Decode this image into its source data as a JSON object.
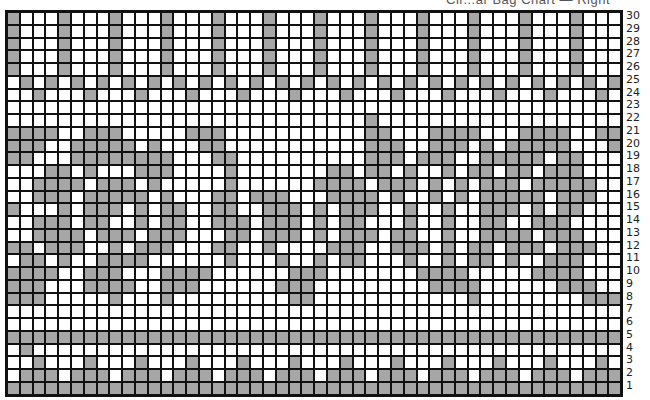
{
  "chart": {
    "title": "Cir...ar Bag Chart — Right",
    "columns": 48,
    "rows": 30,
    "colors": {
      "filled": "#a6a6a6",
      "empty": "#ffffff",
      "line": "#111111"
    },
    "row_labels": [
      "30",
      "29",
      "28",
      "27",
      "26",
      "25",
      "24",
      "23",
      "22",
      "21",
      "20",
      "19",
      "18",
      "17",
      "16",
      "15",
      "14",
      "13",
      "12",
      "11",
      "10",
      "9",
      "8",
      "7",
      "6",
      "5",
      "4",
      "3",
      "2",
      "1"
    ],
    "grid_rows_top_to_bottom": [
      "GWWWGWWWGWWWGWWWGWWWGWWWGWWWGWWWGWWWGWWWGWWWGWWW",
      "GWWWGWWWGWWWGWWWGWWWGWWWGWWWGWWWGWWWGWWWGWWWGWWW",
      "GWWWGWWWGWWWGWWWGWWWGWWWGWWWGWWWGWWWGWWWGWWWGWWW",
      "GWWWGWWWGWWWGWWWGWWWGWWWGWWWGWWWGWWWGWWWGWWWGWWW",
      "GWWWGWWWGWWWGWWWGWWWGWWWGWWWGWWWGWWWGWWWGWWWGWWW",
      "WGWGWGWGWGWGWGWGWGWGWGWGWGWGWGWGWGWGWGWGWGWGWGWG",
      "WWGWWWGWWWGWWWGWWWGWWWGWWWGWWWGWWWGWWWGWWWGWWWGW",
      "WWWWWWWWWWWWWWWWWWWWWWWWWWWWWWWWWWWWWWWWWWWWWWWW",
      "WWWWWWWWWWWWWWWWWWWWWWWWWWWWGWWWWWWWWWWWWWWWWWWW",
      "GGGGWWGGGWWWWWGGGWWWWWWWWWWWGGWWWGGGGWWWGGGGWWGG",
      "GGGWWGGGGGWGWWWGGWWWWWWWWWWWGGGWWGGGWGWGGGGGWWWG",
      "GGWWWGGGGGGGGWWWGGWWWWWWWWWWGGGWGGGWWGGGGGWGGWWW",
      "WWWGGWGWWWGGGWWWWGWWWWWWWGGWGGWGWWGWGGWGGWGGGWWW",
      "WWGGGGWGGGWGWWWWWGWWWWWWGGGGWGGGWGWGWGGGWGGGGGWW",
      "WWGGGWGGGGGWGWWWGGWGGGWWWGGGGWGWWGWGWGGGGGWGGGWW",
      "GWWWGWGGGWGWGGWWGGWWGGGWGWGGGWWGWWGWWGGGWGWGGWWW",
      "WWGGGWGGWWGWGGWWGGGWGGGWGWGGWWWGWWGWWGGWWGGGWWWW",
      "WWGGGGWGGGWGGGWWWGGWGGGWGWGGGWGGWWGWWGGGGWGGGWWW",
      "GGWGGGWWGWGGGWWWGGWWGWWWWGGGWWGGGWGWGGWGGGWGGGWW",
      "WGGWGWWGGGGWWWWWWGWWWGWWGWGGWWWGWWGWGGWGWWGGGWWW",
      "GGGGWWGGGWWWGGGGWWWWWWGGGWWWWWWWGGGGWWWWWGGGGWWW",
      "GGGWWWGGGGWWGGGWWWWWWGGGWWWWWWWWWGGGGWWWWWWGGGWW",
      "GGGWWWWWGWWWGWWWWWWWWWGGWWWWWWWWWWWWGWWWWWWWWGGG",
      "WWWWWWWWWWWWWWWWWWWWWWWWWWWWWWWWWWWWWWWWWWWWWWWW",
      "WWWWWWWWWWWWWWWWWWWWWWWWWWWWWWWWWWWWWWWWWWWWWWWW",
      "GGGGGGGGGGGGGGGGGGGGGGGGGGGGGGGGGGGGGGGGGGGGGGGG",
      "WGWWWWWWWWWWWWWWWWWWWWWWWWWWWWWWWWWWWWWWWWWWWWWW",
      "WWGWWWGWWWGWWWGWWWGWWWGWWWGWWWGWWWGWWWGWWWGWWWGW",
      "WGGGWGGGWGGGWGGGWGGGWGGGWGGGWGGGWGGGWGGGWGGGWGGG",
      "GGGGGGGGGGGGGGGGGGGGGGGGGGGGGGGGGGGGGGGGGGGGGGGG"
    ]
  }
}
